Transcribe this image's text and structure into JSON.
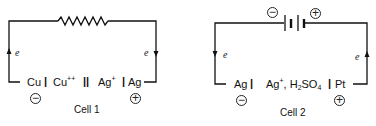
{
  "cells": [
    {
      "caption": "Cell 1",
      "external_element": "resistor",
      "anode": "Cu",
      "anode_sign": "−",
      "anode_electrolyte": "Cu++",
      "salt_bridge": "||",
      "cathode_electrolyte": "Ag+",
      "cathode": "Ag",
      "cathode_sign": "+",
      "electron_left": "e",
      "electron_right": "e",
      "electron_flow": "left wire up, right wire down"
    },
    {
      "caption": "Cell 2",
      "external_element": "battery",
      "battery_neg_sign": "−",
      "battery_pos_sign": "+",
      "anode": "Ag",
      "anode_sign": "−",
      "electrolyte_main": "Ag",
      "electrolyte_sup": "+",
      "electrolyte_rest": ", H",
      "electrolyte_sub": "2",
      "electrolyte_end": "SO",
      "electrolyte_sub2": "4",
      "cathode": "Pt",
      "cathode_sign": "+",
      "electron_left": "e",
      "electron_right": "e",
      "electron_flow": "left wire down, right wire up"
    }
  ],
  "labels": {
    "cu_sup": "++",
    "ag_sup": "+",
    "sep_single": "|",
    "sep_double": "||"
  }
}
